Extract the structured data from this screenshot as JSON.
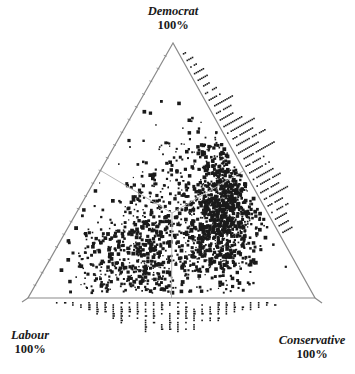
{
  "chart_data": {
    "type": "scatter",
    "subtype": "ternary",
    "title": "",
    "axes": [
      {
        "name": "Democrat",
        "vertex": "top",
        "label": "Democrat",
        "max_label": "100%"
      },
      {
        "name": "Labour",
        "vertex": "bottom-left",
        "label": "Labour",
        "max_label": "100%"
      },
      {
        "name": "Conservative",
        "vertex": "bottom-right",
        "label": "Conservative",
        "max_label": "100%"
      }
    ],
    "grid": false,
    "legend": null,
    "region_boundaries": {
      "description": "Three thin gray lines meeting at the equal-share point (1/3, 1/3, 1/3), dividing the triangle into Labour, Conservative and Democrat winning regions",
      "center": {
        "Labour": 0.333,
        "Conservative": 0.333,
        "Democrat": 0.333
      }
    },
    "series": [
      {
        "name": "Constituencies",
        "description": "Dense scatter of constituency vote shares; main mass along the Conservative-leaning right side with low Democrat share, plus a band along the bottom (low Democrat) from Labour to Conservative",
        "clusters": [
          {
            "label": "Conservative-heavy core",
            "center": {
              "Labour": 0.18,
              "Conservative": 0.52,
              "Democrat": 0.3
            },
            "spread": 0.09,
            "count": 900,
            "density": "high"
          },
          {
            "label": "Conservative-Democrat band",
            "center": {
              "Labour": 0.1,
              "Conservative": 0.48,
              "Democrat": 0.42
            },
            "spread": 0.07,
            "count": 350,
            "density": "medium"
          },
          {
            "label": "Labour-Conservative bottom band",
            "center": {
              "Labour": 0.52,
              "Conservative": 0.36,
              "Democrat": 0.12
            },
            "spread": 0.1,
            "count": 500,
            "density": "high"
          },
          {
            "label": "Labour-heavy",
            "center": {
              "Labour": 0.7,
              "Conservative": 0.16,
              "Democrat": 0.14
            },
            "spread": 0.08,
            "count": 160,
            "density": "medium"
          },
          {
            "label": "Scattered middle",
            "center": {
              "Labour": 0.35,
              "Conservative": 0.3,
              "Democrat": 0.35
            },
            "spread": 0.13,
            "count": 260,
            "density": "low"
          }
        ]
      }
    ],
    "marginal_rugs": [
      {
        "side": "right (Conservative-Democrat edge)",
        "style": "horizontal dot strips perpendicular to edge",
        "strips": 28,
        "position_range": [
          0.25,
          0.95
        ],
        "longest_near": 0.55
      },
      {
        "side": "bottom (Labour-Conservative edge)",
        "style": "vertical dot strips below edge",
        "strips": 28,
        "position_range": [
          0.1,
          0.86
        ],
        "longest_near": 0.5
      },
      {
        "side": "left (Labour-Democrat edge)",
        "style": "small tick marks on edge",
        "strips": 16,
        "position_range": [
          0.1,
          0.75
        ]
      }
    ]
  },
  "labels": {
    "top": {
      "name": "Democrat",
      "pct": "100%"
    },
    "left": {
      "name": "Labour",
      "pct": "100%"
    },
    "right": {
      "name": "Conservative",
      "pct": "100%"
    }
  },
  "geometry": {
    "apex": [
      173,
      43
    ],
    "bottom_left": [
      28,
      298
    ],
    "bottom_right": [
      315,
      298
    ]
  },
  "colors": {
    "axis": "#8a8a8a",
    "region_lines": "#b5b5b5",
    "points": "#1a1a1a",
    "text": "#1a1a1a"
  }
}
